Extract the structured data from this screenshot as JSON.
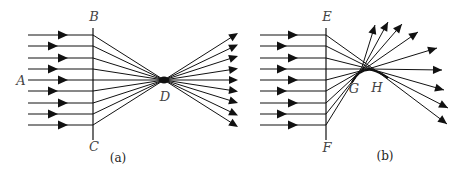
{
  "panels": [
    {
      "id": "a",
      "caption": "(a)",
      "labels": {
        "A": "A",
        "B": "B",
        "C": "C",
        "D": "D"
      },
      "description": "Parallel rays from A pass through aperture BC and converge to focal point D, then diverge",
      "ray_count": 9
    },
    {
      "id": "b",
      "caption": "(b)",
      "labels": {
        "E": "E",
        "F": "F",
        "G": "G",
        "H": "H"
      },
      "description": "Parallel rays pass through aperture EF and converge along caustic segment GH, then diverge",
      "ray_count": 9
    }
  ],
  "colors": {
    "line": "#111111",
    "label": "#444444"
  }
}
